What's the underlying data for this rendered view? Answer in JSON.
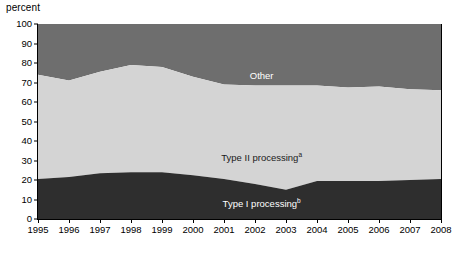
{
  "axis_unit_label": "percent",
  "colors": {
    "other": "#6e6e6e",
    "type2": "#d4d4d4",
    "type1": "#2e2e2e",
    "axis": "#000000",
    "background": "#ffffff"
  },
  "labels": {
    "other": "Other",
    "type2": "Type II processing",
    "type2_note": "a",
    "type1": "Type I processing",
    "type1_note": "b"
  },
  "chart_data": {
    "type": "area",
    "stacked": true,
    "title": "",
    "xlabel": "",
    "ylabel": "percent",
    "ylim": [
      0,
      100
    ],
    "yticks": [
      0,
      10,
      20,
      30,
      40,
      50,
      60,
      70,
      80,
      90,
      100
    ],
    "grid": false,
    "legend": "inline-annotations",
    "categories": [
      "1995",
      "1996",
      "1997",
      "1998",
      "1999",
      "2000",
      "2001",
      "2002",
      "2003",
      "2004",
      "2005",
      "2006",
      "2007",
      "2008"
    ],
    "x": [
      1995,
      1996,
      1997,
      1998,
      1999,
      2000,
      2001,
      2002,
      2003,
      2004,
      2005,
      2006,
      2007,
      2008
    ],
    "series": [
      {
        "name": "Type I processing",
        "values": [
          20.5,
          21.5,
          23.5,
          24.0,
          24.0,
          22.5,
          20.5,
          18.0,
          15.0,
          19.5,
          19.5,
          19.5,
          20.0,
          20.5
        ]
      },
      {
        "name": "Type II processing",
        "values": [
          53.5,
          49.5,
          52.0,
          55.0,
          54.0,
          50.5,
          48.5,
          50.5,
          53.5,
          49.0,
          48.0,
          48.5,
          46.5,
          45.5
        ]
      },
      {
        "name": "Other",
        "values": [
          26.0,
          29.0,
          24.5,
          21.0,
          22.0,
          27.0,
          31.0,
          31.5,
          31.5,
          31.5,
          32.5,
          32.0,
          33.5,
          34.0
        ]
      }
    ],
    "cumulative_upper_bounds": {
      "type1": [
        20.5,
        21.5,
        23.5,
        24.0,
        24.0,
        22.5,
        20.5,
        18.0,
        15.0,
        19.5,
        19.5,
        19.5,
        20.0,
        20.5
      ],
      "type2": [
        74.0,
        71.0,
        75.5,
        79.0,
        78.0,
        73.0,
        69.0,
        68.5,
        68.5,
        68.5,
        67.5,
        68.0,
        66.5,
        66.0
      ],
      "other": [
        100,
        100,
        100,
        100,
        100,
        100,
        100,
        100,
        100,
        100,
        100,
        100,
        100,
        100
      ]
    }
  }
}
